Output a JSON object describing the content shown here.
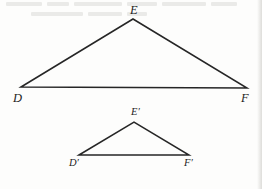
{
  "figure": {
    "type": "geometry-diagram",
    "background_color": "#fdfdfc",
    "stroke_color": "#262626",
    "stroke_width": 1.5,
    "label_color": "#1d1d1d",
    "canvas": {
      "width": 262,
      "height": 189
    },
    "shapes": [
      {
        "id": "triangle-def",
        "name": "triangle-DEF",
        "role": "preimage",
        "vertices": [
          {
            "label": "D",
            "x": 21,
            "y": 87
          },
          {
            "label": "E",
            "x": 133,
            "y": 19
          },
          {
            "label": "F",
            "x": 247,
            "y": 88
          }
        ],
        "points_attr": "21,87 133,19 247,88"
      },
      {
        "id": "triangle-dpepfp",
        "name": "triangle-D-prime-E-prime-F-prime",
        "role": "image",
        "vertices": [
          {
            "label": "D′",
            "x": 79,
            "y": 155
          },
          {
            "label": "E′",
            "x": 134,
            "y": 122
          },
          {
            "label": "F′",
            "x": 189,
            "y": 155
          }
        ],
        "points_attr": "79,155 134,122 189,155"
      }
    ],
    "labels": {
      "D": "D",
      "E": "E",
      "F": "F",
      "D_prime": "D′",
      "E_prime": "E′",
      "F_prime": "F′"
    },
    "artifacts": {
      "bleed_through_top": true,
      "right_edge_scan_strip": true
    }
  }
}
